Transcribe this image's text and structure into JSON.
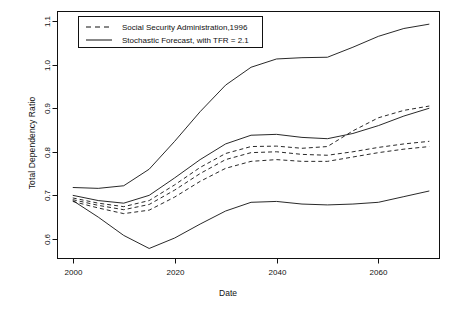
{
  "chart_data": {
    "type": "line",
    "title": "",
    "xlabel": "Date",
    "ylabel": "Total Dependency Ratio",
    "xlim": [
      1997,
      2072
    ],
    "ylim": [
      0.555,
      1.122
    ],
    "xticks": [
      2000,
      2020,
      2040,
      2060
    ],
    "yticks": [
      0.6,
      0.7,
      0.8,
      0.9,
      1.0,
      1.1
    ],
    "ytick_labels": [
      "0.6",
      "0.7",
      "0.8",
      "0.9",
      "1.0",
      "1.1"
    ],
    "xtick_labels": [
      "2000",
      "2020",
      "2040",
      "2060"
    ],
    "grid": false,
    "legend_position": "top-left",
    "legend": [
      {
        "label": "Social Security Administration,1996",
        "style": "dashed"
      },
      {
        "label": "Stochastic Forecast, with TFR = 2.1",
        "style": "solid"
      }
    ],
    "x": [
      2000,
      2005,
      2010,
      2015,
      2020,
      2025,
      2030,
      2035,
      2040,
      2045,
      2050,
      2055,
      2060,
      2065,
      2070
    ],
    "series": [
      {
        "name": "Stochastic Forecast upper bound",
        "style": "solid",
        "values": [
          0.718,
          0.716,
          0.722,
          0.76,
          0.824,
          0.892,
          0.953,
          0.994,
          1.013,
          1.016,
          1.017,
          1.04,
          1.065,
          1.083,
          1.093
        ]
      },
      {
        "name": "Stochastic Forecast median",
        "style": "solid",
        "values": [
          0.7,
          0.688,
          0.682,
          0.7,
          0.74,
          0.782,
          0.818,
          0.838,
          0.84,
          0.833,
          0.83,
          0.842,
          0.86,
          0.882,
          0.9
        ]
      },
      {
        "name": "SSA 1996 high",
        "style": "dashed",
        "values": [
          0.694,
          0.682,
          0.674,
          0.688,
          0.724,
          0.764,
          0.796,
          0.812,
          0.813,
          0.808,
          0.812,
          0.848,
          0.878,
          0.895,
          0.905
        ]
      },
      {
        "name": "SSA 1996 intermediate",
        "style": "dashed",
        "values": [
          0.69,
          0.677,
          0.667,
          0.679,
          0.712,
          0.75,
          0.782,
          0.798,
          0.8,
          0.794,
          0.792,
          0.8,
          0.81,
          0.818,
          0.824
        ]
      },
      {
        "name": "SSA 1996 low",
        "style": "dashed",
        "values": [
          0.686,
          0.671,
          0.658,
          0.666,
          0.696,
          0.732,
          0.762,
          0.778,
          0.782,
          0.778,
          0.778,
          0.788,
          0.798,
          0.806,
          0.812
        ]
      },
      {
        "name": "Stochastic Forecast lower bound",
        "style": "solid",
        "values": [
          0.688,
          0.65,
          0.608,
          0.578,
          0.602,
          0.634,
          0.664,
          0.684,
          0.686,
          0.68,
          0.678,
          0.68,
          0.684,
          0.697,
          0.71
        ]
      }
    ]
  }
}
